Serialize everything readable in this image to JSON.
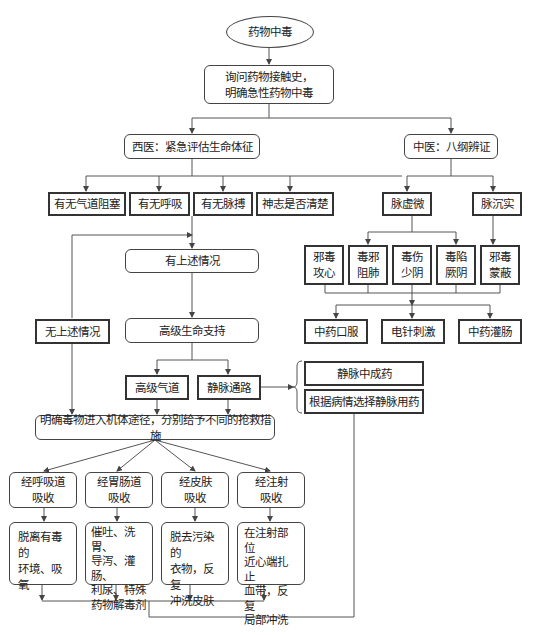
{
  "diagram": {
    "start": "药物中毒",
    "inquiry": "询问药物接触史，\n明确急性药物中毒",
    "western": {
      "title": "西医：紧急评估生命体征",
      "checks": [
        "有无气道阻塞",
        "有无呼吸",
        "有无脉搏",
        "神志是否清楚"
      ],
      "yes": "有上述情况",
      "no": "无上述情况",
      "als": "高级生命支持",
      "als_children": [
        "高级气道",
        "静脉通路"
      ],
      "iv_options": [
        "静脉中成药",
        "根据病情选择静脉用药"
      ],
      "route_title": "明确毒物进入机体途径，分别给予不同的抢救措施",
      "routes": [
        {
          "route": "经呼吸道\n吸收",
          "action": "脱离有毒的\n环境、吸氧"
        },
        {
          "route": "经胃肠道\n吸收",
          "action": "催吐、洗胃、\n导泻、灌肠、\n利尿、特殊\n药物解毒剂"
        },
        {
          "route": "经皮肤\n吸收",
          "action": "脱去污染的\n衣物，反复\n冲洗皮肤"
        },
        {
          "route": "经注射\n吸收",
          "action": "在注射部位\n近心端扎止\n血带，反复\n局部冲洗"
        }
      ]
    },
    "tcm": {
      "title": "中医：八纲辨证",
      "pulses": [
        "脉虚微",
        "脉沉实"
      ],
      "patterns": [
        "邪毒\n攻心",
        "毒邪\n阻肺",
        "毒伤\n少阴",
        "毒陷\n厥阴",
        "邪毒\n蒙蔽"
      ],
      "treatments": [
        "中药口服",
        "电针刺激",
        "中药灌肠"
      ]
    }
  }
}
